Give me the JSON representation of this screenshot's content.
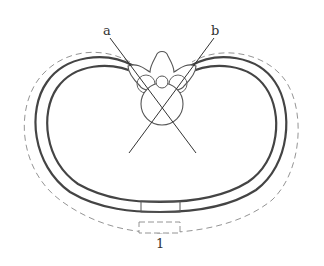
{
  "figure": {
    "type": "cross-section diagram",
    "labels": {
      "a": "a",
      "b": "b",
      "one": "1"
    },
    "elements": [
      "outer thoracic wall contour",
      "inner thoracic wall contour",
      "dashed displaced outer contour",
      "vertebra with spinous process and spinal canal",
      "sternum segment",
      "dashed sternum segment",
      "line a",
      "line b"
    ],
    "colors": {
      "line": "#444444",
      "dashed": "#888888",
      "background": "#ffffff"
    }
  }
}
